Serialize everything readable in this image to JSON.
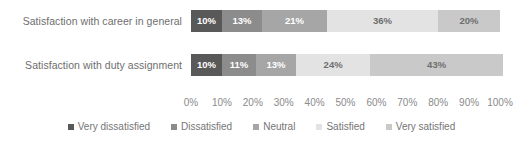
{
  "chart_data": {
    "type": "bar",
    "orientation": "horizontal",
    "stacked": true,
    "stack_mode": "percent",
    "title": "",
    "subtitle": "",
    "xlabel": "",
    "ylabel": "",
    "xlim": [
      0,
      100
    ],
    "grid": false,
    "legend_position": "bottom",
    "categories": [
      "Satisfaction with career in general",
      "Satisfaction with duty assignment"
    ],
    "series": [
      {
        "name": "Very dissatisfied",
        "color": "#595959",
        "label_color": "#ffffff",
        "values": [
          10,
          10
        ],
        "labels": [
          "10%",
          "10%"
        ]
      },
      {
        "name": "Dissatisfied",
        "color": "#8c8c8c",
        "label_color": "#ffffff",
        "values": [
          13,
          11
        ],
        "labels": [
          "13%",
          "11%"
        ]
      },
      {
        "name": "Neutral",
        "color": "#a6a6a6",
        "label_color": "#ffffff",
        "values": [
          21,
          13
        ],
        "labels": [
          "21%",
          "13%"
        ]
      },
      {
        "name": "Satisfied",
        "color": "#e3e3e3",
        "label_color": "#6e6e6e",
        "values": [
          36,
          24
        ],
        "labels": [
          "36%",
          "24%"
        ]
      },
      {
        "name": "Very satisfied",
        "color": "#c9c9c9",
        "label_color": "#6e6e6e",
        "values": [
          20,
          43
        ],
        "labels": [
          "20%",
          "43%"
        ]
      }
    ],
    "x_ticks": [
      "0%",
      "10%",
      "20%",
      "30%",
      "40%",
      "50%",
      "60%",
      "70%",
      "80%",
      "90%",
      "100%"
    ],
    "x_tick_values": [
      0,
      10,
      20,
      30,
      40,
      50,
      60,
      70,
      80,
      90,
      100
    ]
  },
  "axis": {
    "category_labels": [
      "Satisfaction with career in general",
      "Satisfaction with duty assignment"
    ]
  },
  "legend": {
    "items": [
      {
        "label": "Very dissatisfied"
      },
      {
        "label": "Dissatisfied"
      },
      {
        "label": "Neutral"
      },
      {
        "label": "Satisfied"
      },
      {
        "label": "Very satisfied"
      }
    ]
  },
  "colors": {
    "very_dissatisfied": "#595959",
    "dissatisfied": "#8c8c8c",
    "neutral": "#a6a6a6",
    "satisfied": "#e3e3e3",
    "very_satisfied": "#c9c9c9",
    "text": "#6e6e6e",
    "tick_text": "#8a8a8a",
    "background": "#ffffff"
  }
}
